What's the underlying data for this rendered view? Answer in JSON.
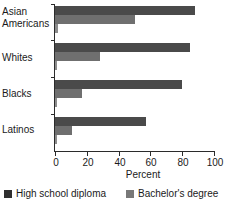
{
  "chart_data": {
    "type": "bar",
    "orientation": "horizontal",
    "title": "",
    "xlabel": "Percent",
    "ylabel": "",
    "xlim": [
      0,
      100
    ],
    "xticks": [
      0,
      20,
      40,
      60,
      80,
      100
    ],
    "xticklabels": [
      "0",
      "20",
      "40",
      "60",
      "80",
      "100"
    ],
    "grid": false,
    "legend_position": "bottom",
    "categories": [
      "Asian Americans",
      "Whites",
      "Blacks",
      "Latinos"
    ],
    "category_lines": [
      [
        "Asian",
        "Americans"
      ],
      [
        "Whites"
      ],
      [
        "Blacks"
      ],
      [
        "Latinos"
      ]
    ],
    "series": [
      {
        "name": "High school diploma",
        "color": "#4a4a4a",
        "in_legend": true,
        "values": [
          88,
          85,
          80,
          57
        ]
      },
      {
        "name": "Bachelor's degree",
        "color": "#6f6f6f",
        "in_legend": true,
        "values": [
          50,
          28,
          17,
          11
        ]
      },
      {
        "name": "",
        "color": "#8c8c8c",
        "in_legend": false,
        "values": [
          2,
          1,
          1,
          1
        ]
      }
    ]
  },
  "legend": {
    "entries": [
      {
        "label": "High school diploma",
        "swatch": "dark-swatch-icon"
      },
      {
        "label": "Bachelor's degree",
        "swatch": "gray-swatch-icon"
      }
    ]
  }
}
